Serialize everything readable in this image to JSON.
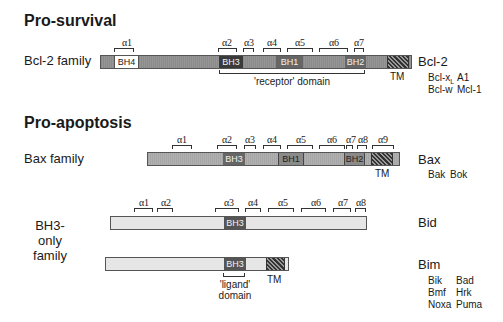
{
  "sections": {
    "pro_survival": "Pro-survival",
    "pro_apoptosis": "Pro-apoptosis"
  },
  "families": {
    "bcl2": {
      "label": "Bcl-2 family",
      "name": "Bcl-2",
      "members": [
        "Bcl-xL",
        "A1",
        "Bcl-w",
        "Mcl-1"
      ],
      "domains": {
        "bh4": "BH4",
        "bh3": "BH3",
        "bh1": "BH1",
        "bh2": "BH2",
        "tm": "TM"
      },
      "helices": [
        "α1",
        "α2",
        "α3",
        "α4",
        "α5",
        "α6",
        "α7"
      ],
      "receptor_label": "'receptor' domain"
    },
    "bax": {
      "label": "Bax family",
      "name": "Bax",
      "members": [
        "Bak",
        "Bok"
      ],
      "domains": {
        "bh3": "BH3",
        "bh1": "BH1",
        "bh2": "BH2",
        "tm": "TM"
      },
      "helices": [
        "α1",
        "α2",
        "α3",
        "α4",
        "α5",
        "α6",
        "α7",
        "α8",
        "α9"
      ]
    },
    "bh3only": {
      "label_line1": "BH3-only",
      "label_line2": "family",
      "bid": {
        "name": "Bid",
        "domains": {
          "bh3": "BH3"
        },
        "helices": [
          "α1",
          "α2",
          "α3",
          "α4",
          "α5",
          "α6",
          "α7",
          "α8"
        ]
      },
      "bim": {
        "name": "Bim",
        "domains": {
          "bh3": "BH3",
          "tm": "TM"
        },
        "ligand_line1": "'ligand'",
        "ligand_line2": "domain",
        "members": [
          "Bik",
          "Bad",
          "Bmf",
          "Hrk",
          "Noxa",
          "Puma"
        ]
      }
    }
  },
  "colors": {
    "bcl2_bar": "#8c8c8c",
    "bax_bar": "#a8a8a8",
    "bh3only_bar": "#e6e6e6",
    "bh_dark": "#4a4a4a",
    "bh4_box": "#ffffff"
  }
}
